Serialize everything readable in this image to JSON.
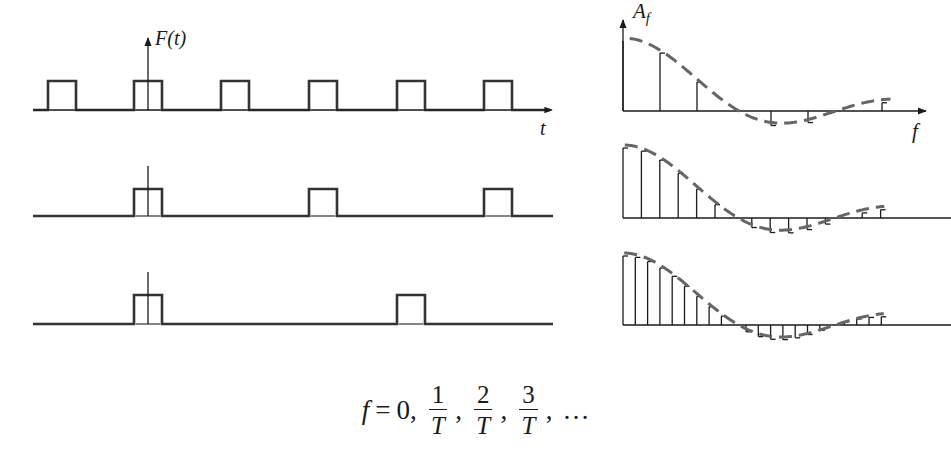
{
  "figure": {
    "time_axis_label": "F(t)",
    "time_axis_var": "t",
    "freq_axis_label": "A",
    "freq_axis_subscript": "f",
    "freq_axis_var": "f"
  },
  "formula": {
    "lhs": "f",
    "eq": "=",
    "first": "0,",
    "fractions": [
      {
        "num": "1",
        "den": "T"
      },
      {
        "num": "2",
        "den": "T"
      },
      {
        "num": "3",
        "den": "T"
      }
    ],
    "ellipsis": "…",
    "comma": ","
  },
  "colors": {
    "ink": "#333333",
    "axis": "#1a1a1a",
    "envelope": "#666666"
  },
  "chart_data": [
    {
      "type": "line",
      "title": "Periodic rectangular pulse train, period T (row 1)",
      "xlabel": "t",
      "ylabel": "F(t)",
      "period_px": 87.5,
      "pulse_width_px": 28,
      "pulse_starts_px": [
        48,
        134,
        221,
        309,
        397,
        484
      ],
      "baseline_y": 110,
      "pulse_top_y": 81
    },
    {
      "type": "line",
      "title": "Pulse train, period 2T (row 2)",
      "period_px": 175,
      "pulse_width_px": 28,
      "pulse_starts_px": [
        134,
        309,
        484
      ],
      "baseline_y": 216,
      "pulse_top_y": 189
    },
    {
      "type": "line",
      "title": "Pulse train, period 3T (row 3)",
      "period_px": 263,
      "pulse_width_px": 28,
      "pulse_starts_px": [
        134,
        397
      ],
      "baseline_y": 324,
      "pulse_top_y": 295
    },
    {
      "type": "bar",
      "title": "Amplitude spectrum A_f (row 1), lines at f = n/T",
      "xlabel": "f",
      "ylabel": "A_f",
      "harmonic_spacing_px": 37,
      "baseline_y": 111,
      "peak_px": 70,
      "first_zero_harmonic": 3,
      "values": [
        1,
        0.827,
        0.413,
        0,
        -0.207,
        -0.165,
        0,
        0.118
      ],
      "envelope": "sinc (dashed)"
    },
    {
      "type": "bar",
      "title": "Amplitude spectrum (row 2)",
      "harmonic_spacing_px": 18.4,
      "baseline_y": 218,
      "peak_px": 70,
      "first_zero_harmonic": 6,
      "values": [
        1,
        0.955,
        0.827,
        0.637,
        0.413,
        0.191,
        0,
        -0.136,
        -0.207,
        -0.212,
        -0.165,
        -0.087,
        0,
        0.073,
        0.118
      ],
      "envelope": "sinc (dashed)"
    },
    {
      "type": "bar",
      "title": "Amplitude spectrum (row 3)",
      "harmonic_spacing_px": 12.3,
      "baseline_y": 325,
      "peak_px": 69,
      "first_zero_harmonic": 9,
      "values": [
        1,
        0.98,
        0.92,
        0.827,
        0.705,
        0.563,
        0.413,
        0.264,
        0.129,
        0,
        -0.098,
        -0.168,
        -0.207,
        -0.212,
        -0.186,
        -0.138,
        -0.077,
        0,
        0.046,
        0.087,
        0.11,
        0.118
      ],
      "envelope": "sinc (dashed)"
    }
  ]
}
